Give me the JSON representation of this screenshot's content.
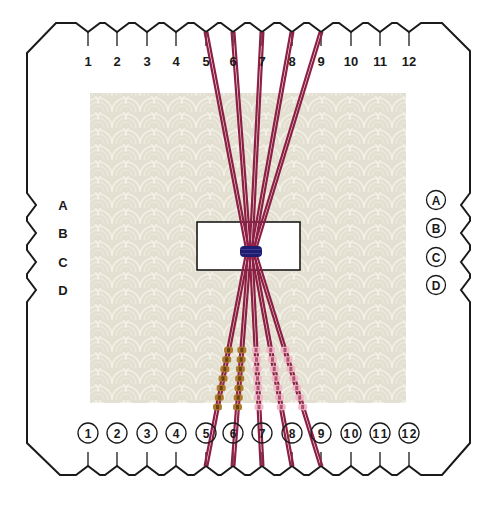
{
  "diagram": {
    "colors": {
      "outline": "#1a1a1a",
      "background_pattern": "#e3e0d2",
      "pattern_line": "#f1efe6",
      "center_hole": "#ffffff",
      "thread": "#8e1f45",
      "binding": "#1f1e6e",
      "bead_gold": "#b07a2c",
      "bead_pink": "#f2b8c8"
    },
    "top_slots": {
      "labels": [
        "1",
        "2",
        "3",
        "4",
        "5",
        "6",
        "7",
        "8",
        "9",
        "10",
        "11",
        "12"
      ],
      "style": "plain"
    },
    "bottom_slots": {
      "labels": [
        "1",
        "2",
        "3",
        "4",
        "5",
        "6",
        "7",
        "8",
        "9",
        "10",
        "11",
        "12"
      ],
      "style": "circled"
    },
    "left_slots": {
      "labels": [
        "A",
        "B",
        "C",
        "D"
      ],
      "style": "plain"
    },
    "right_slots": {
      "labels": [
        "A",
        "B",
        "C",
        "D"
      ],
      "style": "circled"
    },
    "threads": [
      {
        "top_slot": "5",
        "bottom_slot": "5",
        "beads": "gold"
      },
      {
        "top_slot": "6",
        "bottom_slot": "6",
        "beads": "gold"
      },
      {
        "top_slot": "7",
        "bottom_slot": "7",
        "beads": "pink"
      },
      {
        "top_slot": "8",
        "bottom_slot": "8",
        "beads": "pink"
      },
      {
        "top_slot": "9",
        "bottom_slot": "9",
        "beads": "pink"
      }
    ],
    "beads_per_strand": 7
  }
}
